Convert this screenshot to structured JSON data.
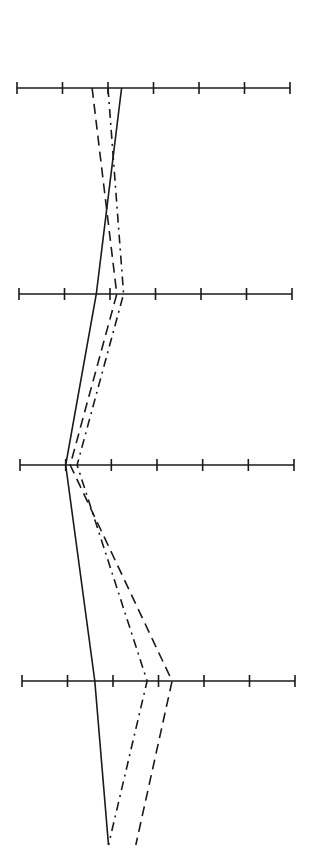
{
  "chart_data": {
    "type": "line",
    "title": "",
    "xlabel": "",
    "ylabel": "",
    "orientation": "profile (horizontal scales stacked vertically)",
    "scale": {
      "min": 0,
      "max": 6,
      "ticks": [
        0,
        1,
        2,
        3,
        4,
        5,
        6
      ]
    },
    "axes": [
      {
        "name": "Scale 1",
        "y": 88,
        "x0": 17,
        "x1": 290
      },
      {
        "name": "Scale 2",
        "y": 294,
        "x0": 19,
        "x1": 292
      },
      {
        "name": "Scale 3",
        "y": 465,
        "x0": 20,
        "x1": 294
      },
      {
        "name": "Scale 4",
        "y": 681,
        "x0": 22,
        "x1": 295
      },
      {
        "name": "End",
        "y": 845,
        "x0": 22,
        "x1": 295,
        "drawn": false
      }
    ],
    "categories": [
      "Scale 1",
      "Scale 2",
      "Scale 3",
      "Scale 4",
      "End"
    ],
    "series": [
      {
        "name": "Solid",
        "style": "solid",
        "values": [
          2.3,
          1.7,
          1.0,
          1.6,
          1.9
        ]
      },
      {
        "name": "Dashed",
        "style": "dashed",
        "values": [
          1.65,
          2.15,
          1.1,
          3.3,
          2.5
        ]
      },
      {
        "name": "Dash-dot",
        "style": "dash-dot",
        "values": [
          2.0,
          2.3,
          1.25,
          2.75,
          1.9
        ]
      }
    ],
    "grid": false,
    "legend": null
  },
  "colors": {
    "ink": "#1a1a1a",
    "background": "#ffffff"
  }
}
